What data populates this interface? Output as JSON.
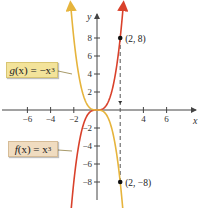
{
  "chart_data": {
    "type": "line",
    "title": "",
    "xlabel": "x",
    "ylabel": "y",
    "xlim": [
      -7.5,
      9
    ],
    "ylim": [
      -10,
      10
    ],
    "grid": false,
    "x_ticks": [
      -6,
      -4,
      -2,
      4,
      6
    ],
    "y_ticks": [
      8,
      6,
      4,
      2,
      -2,
      -4,
      -6,
      -8
    ],
    "x_tick_labels": [
      "−6",
      "−4",
      "−2",
      "4",
      "6"
    ],
    "y_tick_labels": [
      "8",
      "6",
      "4",
      "2",
      "−2",
      "−4",
      "−6",
      "−8"
    ],
    "series": [
      {
        "name": "f(x) = x^3",
        "label_display": "f(x) = x³",
        "color": "#d9412b",
        "x": [
          -2.2,
          -2,
          -1.5,
          -1,
          -0.5,
          0,
          0.5,
          1,
          1.5,
          2,
          2.2
        ],
        "y": [
          -10.65,
          -8,
          -3.375,
          -1,
          -0.125,
          0,
          0.125,
          1,
          3.375,
          8,
          10.65
        ]
      },
      {
        "name": "g(x) = -x^3",
        "label_display": "g(x) = −x³",
        "color": "#e6b43c",
        "x": [
          -2.2,
          -2,
          -1.5,
          -1,
          -0.5,
          0,
          0.5,
          1,
          1.5,
          2,
          2.2
        ],
        "y": [
          10.65,
          8,
          3.375,
          1,
          0.125,
          0,
          -0.125,
          -1,
          -3.375,
          -8,
          -10.65
        ]
      }
    ],
    "points": [
      {
        "x": 2,
        "y": 8,
        "label": "(2, 8)"
      },
      {
        "x": 2,
        "y": -8,
        "label": "(2, −8)"
      }
    ],
    "annotations": [
      {
        "type": "dashed-vertical-line",
        "x": 2,
        "from_y": 8,
        "to_y": -8,
        "arrowhead": "down-at-origin"
      }
    ]
  },
  "labels": {
    "g_func": "g",
    "g_rest": "(x) = −x",
    "g_exp": "3",
    "f_func": "f",
    "f_rest": "(x) = x",
    "f_exp": "3"
  }
}
